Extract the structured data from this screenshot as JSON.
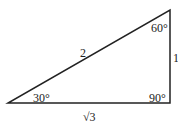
{
  "diagram": {
    "type": "right-triangle",
    "vertices": {
      "bottom_left": {
        "x": 8,
        "y": 103
      },
      "bottom_right": {
        "x": 170,
        "y": 103
      },
      "top_right": {
        "x": 170,
        "y": 10
      }
    },
    "angles": {
      "bottom_left": "30°",
      "top_right": "60°",
      "bottom_right": "90°"
    },
    "sides": {
      "hypotenuse": "2",
      "vertical": "1",
      "horizontal": "√3"
    },
    "colors": {
      "stroke": "#222222",
      "background": "#ffffff"
    }
  }
}
